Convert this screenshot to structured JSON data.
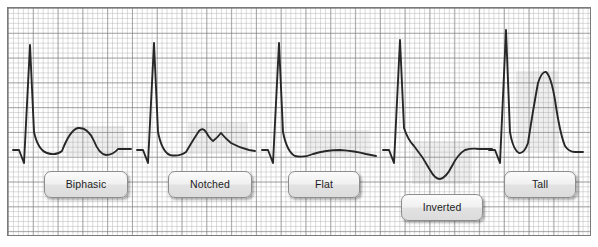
{
  "figure": {
    "background_color": "#ffffff",
    "paper": {
      "name": "ecg-grid-paper",
      "border_color": "#7a7a7a",
      "minor_grid_color": "#aaaaaa",
      "major_grid_color": "#787878",
      "minor_square_px": 5,
      "major_square_px": 25,
      "x": 7,
      "y": 7,
      "width": 584,
      "height": 229
    },
    "trace_color": "#272727",
    "highlight_color": "#9c9c9c",
    "baseline_y": 150
  },
  "panels": [
    {
      "id": "biphasic",
      "label": "Biphasic",
      "description": "T wave that first deflects upward then downward below the baseline",
      "chip": {
        "x": 44,
        "y": 171,
        "width": 84
      },
      "highlight": {
        "x": 66,
        "y": 126,
        "width": 58,
        "height": 30
      },
      "trace": "M 13,150 L 19,150 L 24,163 L 30,45 L 34,132 Q 38,150 47,153 Q 56,156 62,151 Q 70,130 78,128 Q 88,127 94,141 Q 99,154 106,155 Q 113,155 118,149 L 131,149"
    },
    {
      "id": "notched",
      "label": "Notched",
      "description": "T wave with a secondary notch producing two peaks",
      "chip": {
        "x": 168,
        "y": 171,
        "width": 84
      },
      "highlight": {
        "x": 188,
        "y": 122,
        "width": 60,
        "height": 32
      },
      "trace": "M 137,150 L 143,150 L 148,163 L 154,43 L 158,132 Q 162,152 170,155 Q 179,157 186,152 Q 193,140 199,131 Q 203,127 206,132 Q 210,139 213,141 Q 217,138 221,133 Q 225,138 231,143 Q 240,148 249,150 L 255,151"
    },
    {
      "id": "flat",
      "label": "Flat",
      "description": "T wave that is flattened with almost no deflection",
      "chip": {
        "x": 288,
        "y": 171,
        "width": 72
      },
      "highlight": {
        "x": 307,
        "y": 130,
        "width": 62,
        "height": 26
      },
      "trace": "M 262,150 L 268,150 L 273,163 L 279,43 L 283,132 Q 287,152 295,156 Q 304,158 313,154 Q 326,150 340,150 Q 355,151 366,154 L 376,156"
    },
    {
      "id": "inverted",
      "label": "Inverted",
      "description": "T wave deflected below the isoelectric baseline",
      "chip": {
        "x": 401,
        "y": 194,
        "width": 82
      },
      "highlight": {
        "x": 412,
        "y": 141,
        "width": 60,
        "height": 43
      },
      "trace": "M 383,150 L 389,150 L 394,163 L 400,40 L 404,128 Q 408,140 414,146 Q 423,157 430,170 Q 435,179 440,179 Q 446,178 452,166 Q 458,154 465,150 Q 472,148 479,149 L 492,149"
    },
    {
      "id": "tall",
      "label": "Tall",
      "description": "Abnormally tall peaked T wave",
      "chip": {
        "x": 504,
        "y": 171,
        "width": 72
      },
      "highlight": {
        "x": 516,
        "y": 71,
        "width": 42,
        "height": 81
      },
      "trace": "M 489,150 L 495,150 L 500,163 L 506,30 L 510,132 Q 513,150 519,153 Q 524,154 528,143 Q 533,110 538,83 Q 542,71 546,72 Q 551,76 555,100 Q 560,134 565,146 Q 569,152 575,152 L 583,152"
    }
  ]
}
